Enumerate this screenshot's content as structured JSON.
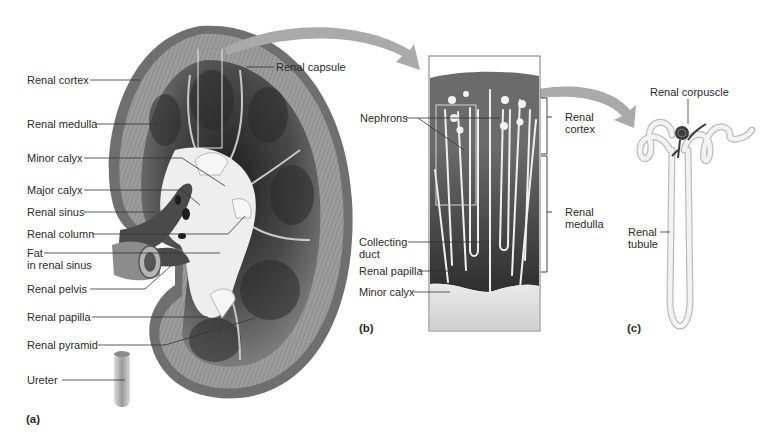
{
  "figure": {
    "panels": [
      {
        "id": "a",
        "letter": "(a)",
        "subject": "kidney-coronal-section",
        "labels": [
          {
            "text": "Renal cortex"
          },
          {
            "text": "Renal medulla"
          },
          {
            "text": "Minor calyx"
          },
          {
            "text": "Major calyx"
          },
          {
            "text": "Renal sinus"
          },
          {
            "text": "Renal column"
          },
          {
            "text": "Fat",
            "line2": "in renal sinus"
          },
          {
            "text": "Renal pelvis"
          },
          {
            "text": "Renal papilla"
          },
          {
            "text": "Renal pyramid"
          },
          {
            "text": "Ureter"
          },
          {
            "text": "Renal capsule"
          }
        ]
      },
      {
        "id": "b",
        "letter": "(b)",
        "subject": "cortex-medulla-magnified",
        "labels": [
          {
            "text": "Nephrons"
          },
          {
            "text": "Collecting",
            "line2": "duct"
          },
          {
            "text": "Renal papilla"
          },
          {
            "text": "Minor calyx"
          },
          {
            "text": "Renal",
            "line2": "cortex"
          },
          {
            "text": "Renal",
            "line2": "medulla"
          }
        ]
      },
      {
        "id": "c",
        "letter": "(c)",
        "subject": "single-nephron",
        "labels": [
          {
            "text": "Renal corpuscle"
          },
          {
            "text": "Renal",
            "line2": "tubule"
          }
        ]
      }
    ],
    "colors": {
      "capsule": "#6e6e6e",
      "cortex": "#9a9a9a",
      "medulla_dark": "#3a3a3a",
      "sinus_light": "#eeeeee",
      "arrow": "#a8a8a8",
      "leader_line": "#333333",
      "tubule_fill": "#f2f2f2",
      "glomerulus": "#3c3c3c"
    }
  }
}
